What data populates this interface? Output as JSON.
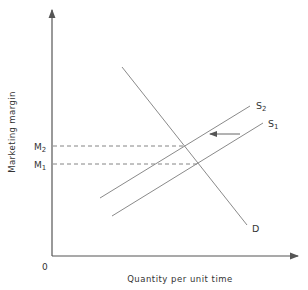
{
  "diagram": {
    "y_axis_label": "Marketing margin",
    "x_axis_label": "Quantity per unit time",
    "origin_label": "0",
    "price_levels": [
      {
        "label": "M",
        "sub": "2",
        "y": 146
      },
      {
        "label": "M",
        "sub": "1",
        "y": 164
      }
    ],
    "curves": [
      {
        "name": "D",
        "label": "D"
      },
      {
        "name": "S1",
        "label": "S",
        "sub": "1"
      },
      {
        "name": "S2",
        "label": "S",
        "sub": "2"
      }
    ],
    "shift_arrow": {
      "direction": "left",
      "from": "S1",
      "to": "S2"
    },
    "colors": {
      "line": "#8a8a8a",
      "axis": "#555555",
      "text": "#333333"
    }
  }
}
